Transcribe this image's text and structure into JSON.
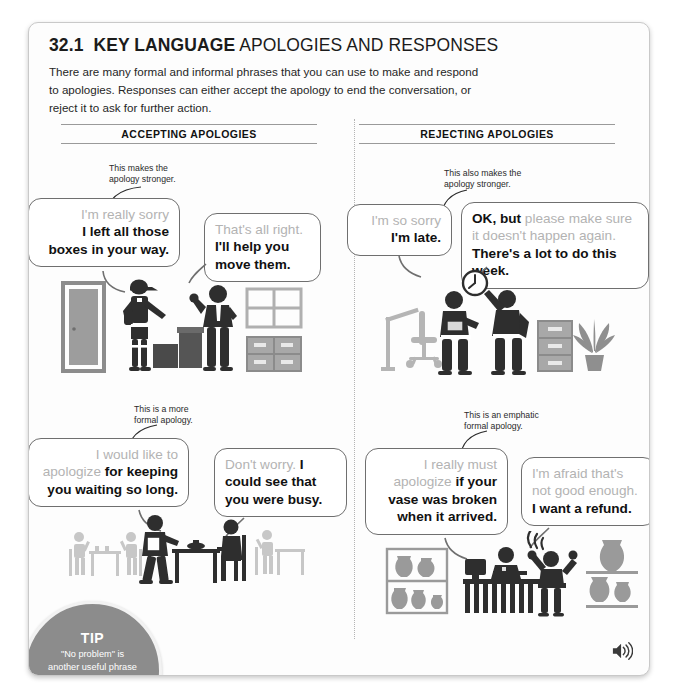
{
  "header": {
    "unit_number": "32.1",
    "title_bold": "KEY LANGUAGE",
    "title_rest": " APOLOGIES AND RESPONSES",
    "intro": "There are many formal and informal phrases that you can use to make and respond to apologies. Responses can either accept the apology to end the conversation, or reject it to ask for further action."
  },
  "columns": {
    "left_heading": "ACCEPTING APOLOGIES",
    "right_heading": "REJECTING APOLOGIES"
  },
  "annotations": {
    "a1_line1": "This makes the",
    "a1_line2": "apology stronger.",
    "a2_line1": "This also makes the",
    "a2_line2": "apology stronger.",
    "a3_line1": "This is a more",
    "a3_line2": "formal apology.",
    "a4_line1": "This is an emphatic",
    "a4_line2": "formal apology."
  },
  "bubbles": {
    "b1": {
      "gray": "I'm really sorry",
      "bold_line1": "I left all those",
      "bold_line2": "boxes in your way."
    },
    "b2": {
      "gray": "That's all right.",
      "bold_line1": "I'll help you",
      "bold_line2": "move them."
    },
    "b3": {
      "gray": "I'm so sorry",
      "bold": "I'm late."
    },
    "b4": {
      "bold_lead": "OK, but",
      "gray_line1": " please make sure",
      "gray_line2": "it doesn't happen again.",
      "bold_line": "There's a lot to do this week."
    },
    "b5": {
      "gray_line1": "I would like to",
      "gray_line2": "apologize",
      "bold_line2_rest": " for keeping",
      "bold_line3": "you waiting so long."
    },
    "b6": {
      "gray": "Don't worry.",
      "bold_tail": " I",
      "bold_line2": "could see that",
      "bold_line3": "you were busy."
    },
    "b7": {
      "gray_line1": "I really must",
      "gray_line2": "apologize",
      "bold_line2_rest": " if your",
      "bold_line3": "vase was broken",
      "bold_line4": "when it arrived."
    },
    "b8": {
      "gray_line1": "I'm afraid that's",
      "gray_line2": "not good enough.",
      "bold_line": "I want a refund."
    }
  },
  "tip": {
    "label": "TIP",
    "line1": "\"No problem\" is",
    "line2": "another useful phrase",
    "line3": "for accepting apologies,",
    "line4": "but this is",
    "line5": "very informal."
  },
  "icons": {
    "audio": "audio-speaker-icon"
  },
  "colors": {
    "page_bg": "#fdfdfd",
    "gray_text": "#b3b3b3",
    "black_text": "#111111",
    "bubble_border": "#6f6f6f",
    "figure_dark": "#2e2e2e",
    "figure_mid": "#8c8c8c",
    "figure_light": "#c4c4c4",
    "tip_bg": "#8c8c8c"
  },
  "scenes": {
    "scene1": "office-delivery-boxes-illustration",
    "scene2": "office-late-arrival-clock-illustration",
    "scene3": "restaurant-waiting-table-illustration",
    "scene4": "shop-broken-vase-complaint-illustration"
  }
}
